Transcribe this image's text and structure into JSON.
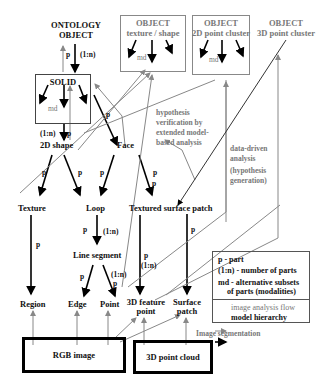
{
  "diagram": {
    "nodes": {
      "ontology_object": "ONTOLOGY\nOBJECT",
      "ontology_object_l1": "ONTOLOGY",
      "ontology_object_l2": "OBJECT",
      "solid": "SOLID",
      "object_texture": {
        "l1": "OBJECT",
        "l2": "texture / shape"
      },
      "object_2d": {
        "l1": "OBJECT",
        "l2": "2D point cluster"
      },
      "object_3d": {
        "l1": "OBJECT",
        "l2": "3D point cluster"
      },
      "shape_2d": "2D shape",
      "face": "Face",
      "texture": "Texture",
      "loop": "Loop",
      "textured_surface_patch": "Textured surface patch",
      "line_segment": "Line segment",
      "region": "Region",
      "edge": "Edge",
      "point": "Point",
      "feature_point_3d": {
        "l1": "3D feature",
        "l2": "point"
      },
      "surface_patch": {
        "l1": "Surface",
        "l2": "patch"
      },
      "rgb_image": "RGB  image",
      "point_cloud_3d": "3D point cloud"
    },
    "edge_labels": {
      "p": "p",
      "one_to_n": "(1:n)",
      "md": "md"
    },
    "annotations": {
      "hypothesis_verification": [
        "hypothesis",
        "verification by",
        "extended model-",
        "based analysis"
      ],
      "data_driven": [
        "data-driven",
        "analysis",
        "(hypothesis",
        "generation)"
      ],
      "image_segmentation": "Image segmentation"
    },
    "legend": {
      "p": "p -   part",
      "one_to_n": "(1:n) - number of parts",
      "md_l1": "md - alternative subsets",
      "md_l2": "of  parts (modalities)",
      "image_analysis_flow": "image analysis flow",
      "model_hierarchy": "model hierarchy"
    },
    "colors": {
      "model_hierarchy": "#000000",
      "image_analysis_flow": "#888888"
    }
  }
}
